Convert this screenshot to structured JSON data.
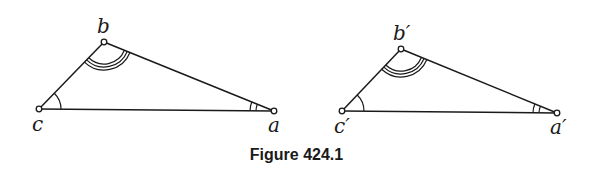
{
  "figure": {
    "caption": "Figure 424.1",
    "triangles": [
      {
        "name": "triangle-abc",
        "vertices": {
          "a": {
            "label": "a",
            "x": 274,
            "y": 111
          },
          "b": {
            "label": "b",
            "x": 104,
            "y": 42
          },
          "c": {
            "label": "c",
            "x": 39,
            "y": 109
          }
        },
        "angle_marks": {
          "b": 3,
          "c": 1,
          "a": 2
        }
      },
      {
        "name": "triangle-a'b'c'",
        "vertices": {
          "a": {
            "label": "a′",
            "x": 557,
            "y": 113
          },
          "b": {
            "label": "b′",
            "x": 401,
            "y": 49
          },
          "c": {
            "label": "c′",
            "x": 342,
            "y": 111
          }
        },
        "angle_marks": {
          "b": 3,
          "c": 1,
          "a": 2
        }
      }
    ]
  }
}
